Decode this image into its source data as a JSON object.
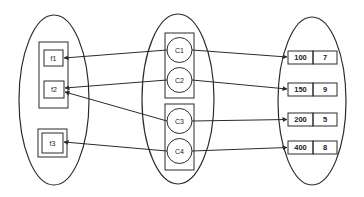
{
  "diagram": {
    "type": "set-mapping",
    "colors": {
      "stroke": "#2b2b2b",
      "background": "#ffffff",
      "text": "#222222"
    },
    "left_set": {
      "groups": [
        {
          "items": [
            {
              "id": "f1",
              "label": "f1"
            },
            {
              "id": "f2",
              "label": "f2"
            }
          ]
        },
        {
          "items": [
            {
              "id": "f3",
              "label": "f3"
            }
          ]
        }
      ]
    },
    "middle_set": {
      "groups": [
        {
          "items": [
            {
              "id": "C1",
              "label": "C1"
            },
            {
              "id": "C2",
              "label": "C2"
            }
          ]
        },
        {
          "items": [
            {
              "id": "C3",
              "label": "C3"
            },
            {
              "id": "C4",
              "label": "C4"
            }
          ]
        }
      ]
    },
    "right_set": {
      "records": [
        {
          "key": "100",
          "value": "7"
        },
        {
          "key": "150",
          "value": "9"
        },
        {
          "key": "200",
          "value": "5"
        },
        {
          "key": "400",
          "value": "8"
        }
      ]
    },
    "edges": [
      {
        "from": "C1",
        "to": "f1"
      },
      {
        "from": "C1",
        "to": "record-100"
      },
      {
        "from": "C2",
        "to": "f2"
      },
      {
        "from": "C2",
        "to": "record-150"
      },
      {
        "from": "C3",
        "to": "f2"
      },
      {
        "from": "C3",
        "to": "record-200"
      },
      {
        "from": "C4",
        "to": "f3"
      },
      {
        "from": "C4",
        "to": "record-400"
      }
    ]
  }
}
